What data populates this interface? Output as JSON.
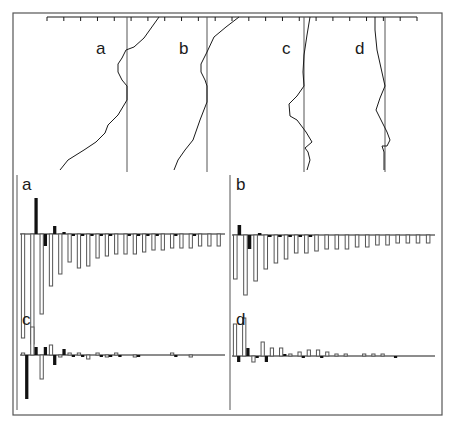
{
  "figure": {
    "frame_color": "#555555",
    "ink_color": "#1a1a1a",
    "gray_bar_fill": "#ffffff",
    "gray_bar_stroke": "#555555",
    "black_bar_fill": "#111111"
  },
  "chart_data": [
    {
      "type": "line",
      "title": "Vertical profiles",
      "panel_labels": [
        "a",
        "b",
        "c",
        "d"
      ],
      "top_axis": {
        "x_start": 47,
        "x_end": 417,
        "tick_count": 23,
        "y": 17
      },
      "profiles": [
        {
          "label": "a",
          "ref_x": 127,
          "points": [
            [
              159,
              17
            ],
            [
              144,
              38
            ],
            [
              134,
              47
            ],
            [
              126,
              50
            ],
            [
              122,
              58
            ],
            [
              118,
              64
            ],
            [
              118,
              72
            ],
            [
              122,
              80
            ],
            [
              127,
              86
            ],
            [
              127,
              100
            ],
            [
              118,
              115
            ],
            [
              108,
              125
            ],
            [
              105,
              133
            ],
            [
              96,
              142
            ],
            [
              84,
              150
            ],
            [
              68,
              160
            ],
            [
              60,
              170
            ]
          ]
        },
        {
          "label": "b",
          "ref_x": 207,
          "points": [
            [
              239,
              17
            ],
            [
              226,
              27
            ],
            [
              214,
              37
            ],
            [
              207,
              52
            ],
            [
              201,
              64
            ],
            [
              201,
              72
            ],
            [
              205,
              80
            ],
            [
              207,
              86
            ],
            [
              207,
              102
            ],
            [
              200,
              120
            ],
            [
              193,
              140
            ],
            [
              185,
              150
            ],
            [
              178,
              160
            ],
            [
              174,
              170
            ]
          ]
        },
        {
          "label": "c",
          "ref_x": 304,
          "points": [
            [
              310,
              17
            ],
            [
              307,
              35
            ],
            [
              304,
              55
            ],
            [
              303,
              72
            ],
            [
              304,
              86
            ],
            [
              297,
              96
            ],
            [
              289,
              104
            ],
            [
              290,
              116
            ],
            [
              297,
              120
            ],
            [
              303,
              128
            ],
            [
              306,
              132
            ],
            [
              312,
              142
            ],
            [
              305,
              148
            ],
            [
              308,
              152
            ],
            [
              310,
              160
            ],
            [
              307,
              170
            ]
          ]
        },
        {
          "label": "d",
          "ref_x": 385,
          "points": [
            [
              375,
              17
            ],
            [
              375,
              30
            ],
            [
              377,
              50
            ],
            [
              381,
              68
            ],
            [
              385,
              86
            ],
            [
              380,
              98
            ],
            [
              376,
              110
            ],
            [
              380,
              118
            ],
            [
              384,
              126
            ],
            [
              387,
              132
            ],
            [
              390,
              140
            ],
            [
              387,
              146
            ],
            [
              382,
              146
            ],
            [
              384,
              152
            ],
            [
              384,
              170
            ]
          ]
        }
      ]
    },
    {
      "type": "bar",
      "label": "a",
      "series": [
        {
          "name": "black",
          "values": [
            0,
            18,
            -6,
            4,
            1,
            -1,
            -1,
            -1,
            -1,
            -1,
            0,
            -1,
            -1,
            -1,
            -1,
            0,
            -1,
            0,
            -1,
            0,
            0,
            0
          ]
        },
        {
          "name": "gray",
          "values": [
            -52,
            -55,
            -40,
            -26,
            -20,
            -14,
            -17,
            -16,
            -12,
            -11,
            -10,
            -10,
            -10,
            -9,
            -8,
            -8,
            -7,
            -7,
            -7,
            -6,
            -6,
            -6
          ]
        }
      ]
    },
    {
      "type": "bar",
      "label": "b",
      "series": [
        {
          "name": "black",
          "values": [
            5,
            -7,
            1,
            -1,
            -1,
            -1,
            -1,
            -1,
            0,
            0,
            0,
            0,
            0,
            0,
            0,
            0,
            0,
            0,
            0,
            0
          ]
        },
        {
          "name": "gray",
          "values": [
            -22,
            -30,
            -23,
            -17,
            -14,
            -12,
            -9,
            -9,
            -8,
            -7,
            -7,
            -7,
            -6,
            -6,
            -5,
            -5,
            -4,
            -4,
            -4,
            -4
          ]
        }
      ]
    },
    {
      "type": "bar",
      "label": "c",
      "series": [
        {
          "name": "black",
          "values": [
            -22,
            4,
            4,
            -5,
            3,
            -1,
            -1,
            0,
            -1,
            -1,
            -1,
            0,
            -1,
            0,
            0,
            0,
            -1,
            0,
            0,
            0,
            0,
            0
          ]
        },
        {
          "name": "gray",
          "values": [
            1,
            14,
            -12,
            5,
            -1,
            1,
            1,
            -2,
            1,
            -1,
            1,
            0,
            -1,
            0,
            0,
            0,
            1,
            0,
            -1,
            0,
            0,
            0
          ]
        }
      ]
    },
    {
      "type": "bar",
      "label": "d",
      "series": [
        {
          "name": "black",
          "values": [
            -3,
            4,
            -1,
            -3,
            0,
            1,
            0,
            -1,
            0,
            -1,
            0,
            0,
            0,
            0,
            0,
            0,
            0,
            -1,
            0,
            0,
            0,
            0
          ]
        },
        {
          "name": "gray",
          "values": [
            16,
            19,
            -3,
            7,
            4,
            4,
            1,
            2,
            3,
            3,
            2,
            1,
            1,
            0,
            1,
            1,
            1,
            0,
            0,
            0,
            0,
            0
          ]
        }
      ]
    }
  ],
  "layout": {
    "outer_frame": {
      "x": 13,
      "y": 13,
      "w": 429,
      "h": 402
    },
    "bar_panels": [
      {
        "label": "a",
        "label_x": 20,
        "label_y": 176,
        "x0": 20,
        "x1": 225,
        "zero_y": 234,
        "scale": 2.0,
        "axis_x": 17,
        "axis_top": 175,
        "axis_bottom": 410
      },
      {
        "label": "b",
        "label_x": 236,
        "label_y": 176,
        "x0": 232,
        "x1": 435,
        "zero_y": 235,
        "scale": 2.0,
        "axis_x": 230,
        "axis_top": 175,
        "axis_bottom": 410
      },
      {
        "label": "c",
        "label_x": 22,
        "label_y": 312,
        "x0": 20,
        "x1": 225,
        "zero_y": 355,
        "scale": 2.0
      },
      {
        "label": "d",
        "label_x": 236,
        "label_y": 312,
        "x0": 232,
        "x1": 435,
        "zero_y": 356,
        "scale": 2.0
      }
    ]
  }
}
